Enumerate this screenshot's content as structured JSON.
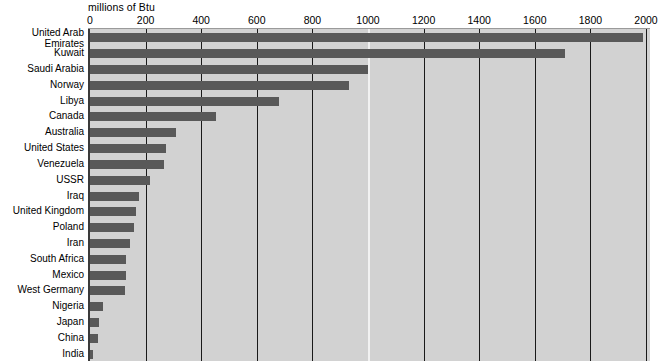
{
  "chart": {
    "axis_title": "millions of Btu",
    "x_tick_labels": [
      "0",
      "200",
      "400",
      "600",
      "800",
      "1000",
      "1200",
      "1400",
      "1600",
      "1800",
      "2000"
    ]
  },
  "chart_data": {
    "type": "bar",
    "orientation": "horizontal",
    "title": "",
    "subtitle": "",
    "xlabel": "millions of Btu",
    "ylabel": "",
    "xlim": [
      0,
      2000
    ],
    "xticks": [
      0,
      200,
      400,
      600,
      800,
      1000,
      1200,
      1400,
      1600,
      1800,
      2000
    ],
    "grid": true,
    "legend": false,
    "categories": [
      "United Arab Emirates",
      "Kuwait",
      "Saudi Arabia",
      "Norway",
      "Libya",
      "Canada",
      "Australia",
      "United States",
      "Venezuela",
      "USSR",
      "Iraq",
      "United Kingdom",
      "Poland",
      "Iran",
      "South Africa",
      "Mexico",
      "West Germany",
      "Nigeria",
      "Japan",
      "China",
      "India"
    ],
    "values": [
      1990,
      1710,
      1000,
      930,
      680,
      455,
      310,
      275,
      265,
      215,
      175,
      165,
      160,
      145,
      130,
      128,
      125,
      48,
      32,
      28,
      12
    ]
  },
  "labels": [
    {
      "text": "United Arab",
      "text2": "Emirates"
    },
    {
      "text": "Kuwait"
    },
    {
      "text": "Saudi Arabia"
    },
    {
      "text": "Norway"
    },
    {
      "text": "Libya"
    },
    {
      "text": "Canada"
    },
    {
      "text": "Australia"
    },
    {
      "text": "United States"
    },
    {
      "text": "Venezuela"
    },
    {
      "text": "USSR"
    },
    {
      "text": "Iraq"
    },
    {
      "text": "United Kingdom"
    },
    {
      "text": "Poland"
    },
    {
      "text": "Iran"
    },
    {
      "text": "South Africa"
    },
    {
      "text": "Mexico"
    },
    {
      "text": "West Germany"
    },
    {
      "text": "Nigeria"
    },
    {
      "text": "Japan"
    },
    {
      "text": "China"
    },
    {
      "text": "India"
    }
  ],
  "colors": {
    "bar": "#595959",
    "plot_background": "#d2d2d2",
    "gridline": "#1a1a1a",
    "highlight_gridline": "#f2f2f2",
    "text": "#000000"
  }
}
